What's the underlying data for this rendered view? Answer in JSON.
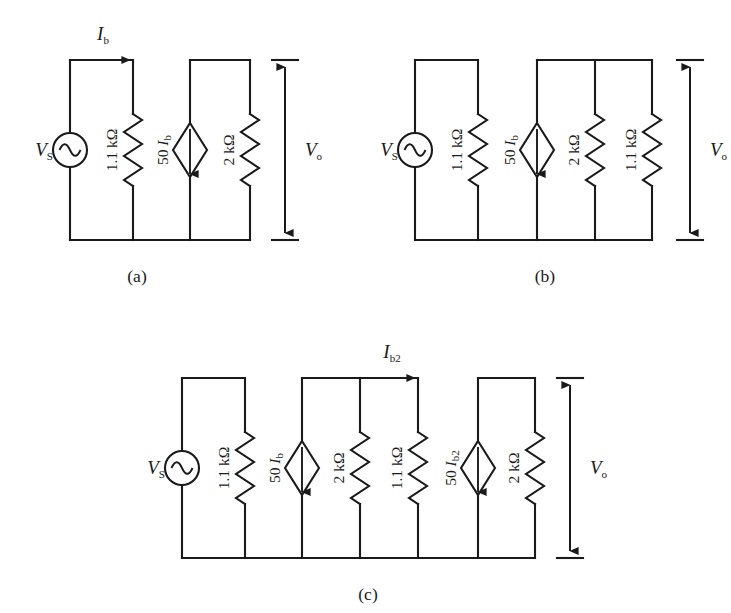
{
  "figure": {
    "line_color": "#1a1a1a",
    "background": "#ffffff",
    "captions": [
      {
        "id": "a",
        "text": "(a)"
      },
      {
        "id": "b",
        "text": "(b)"
      },
      {
        "id": "c",
        "text": "(c)"
      }
    ],
    "source_label": "V",
    "source_sub": "S",
    "output_label": "V",
    "output_sub": "o",
    "current_label": "I",
    "current_sub_a": "b",
    "current_sub_c": "b2"
  },
  "circuits": [
    {
      "id": "a",
      "caption": "(a)",
      "current_arrow": {
        "label_main": "I",
        "label_sub": "b",
        "visible": true
      },
      "output_arrow_label": {
        "main": "V",
        "sub": "o"
      },
      "branches": [
        {
          "type": "ac-source",
          "label_main": "V",
          "label_sub": "S",
          "label_side": "left"
        },
        {
          "type": "resistor",
          "label": "1.1 kΩ"
        },
        {
          "type": "dep-current-source",
          "label_prefix": "50 ",
          "label_main": "I",
          "label_sub": "b",
          "direction": "down"
        },
        {
          "type": "resistor",
          "label": "2 kΩ"
        }
      ]
    },
    {
      "id": "b",
      "caption": "(b)",
      "current_arrow": {
        "label_main": "I",
        "label_sub": "b",
        "visible": false
      },
      "output_arrow_label": {
        "main": "V",
        "sub": "o"
      },
      "branches": [
        {
          "type": "ac-source",
          "label_main": "V",
          "label_sub": "S",
          "label_side": "left"
        },
        {
          "type": "resistor",
          "label": "1.1 kΩ"
        },
        {
          "type": "dep-current-source",
          "label_prefix": "50 ",
          "label_main": "I",
          "label_sub": "b",
          "direction": "down"
        },
        {
          "type": "resistor",
          "label": "2 kΩ"
        },
        {
          "type": "resistor",
          "label": "1.1 kΩ"
        }
      ]
    },
    {
      "id": "c",
      "caption": "(c)",
      "current_arrow": {
        "label_main": "I",
        "label_sub": "b2",
        "visible": true
      },
      "output_arrow_label": {
        "main": "V",
        "sub": "o"
      },
      "branches": [
        {
          "type": "ac-source",
          "label_main": "V",
          "label_sub": "S",
          "label_side": "left"
        },
        {
          "type": "resistor",
          "label": "1.1 kΩ"
        },
        {
          "type": "dep-current-source",
          "label_prefix": "50 ",
          "label_main": "I",
          "label_sub": "b",
          "direction": "down"
        },
        {
          "type": "resistor",
          "label": "2 kΩ"
        },
        {
          "type": "resistor",
          "label": "1.1 kΩ"
        },
        {
          "type": "dep-current-source",
          "label_prefix": "50 ",
          "label_main": "I",
          "label_sub": "b2",
          "direction": "down"
        },
        {
          "type": "resistor",
          "label": "2 kΩ"
        }
      ]
    }
  ],
  "layout": {
    "a": {
      "x0": 70,
      "top": 60,
      "bottom": 240,
      "nodes": [
        70,
        133,
        190,
        250
      ],
      "vo_x": 285,
      "vo_top": 60,
      "vo_bottom": 240,
      "caption_x": 137,
      "caption_y": 282,
      "top_segments": [
        [
          70,
          133
        ],
        [
          190,
          250
        ]
      ],
      "iarrow": {
        "x1": 72,
        "x2": 133,
        "y": 60,
        "lx": 103,
        "ly": 40
      }
    },
    "b": {
      "x0": 415,
      "top": 60,
      "bottom": 240,
      "nodes": [
        415,
        478,
        537,
        595,
        652
      ],
      "vo_x": 690,
      "vo_top": 60,
      "vo_bottom": 240,
      "caption_x": 545,
      "caption_y": 282,
      "top_segments": [
        [
          415,
          478
        ],
        [
          537,
          652
        ]
      ],
      "iarrow": null
    },
    "c": {
      "x0": 182,
      "top": 378,
      "bottom": 558,
      "nodes": [
        182,
        245,
        302,
        360,
        418,
        478,
        535
      ],
      "vo_x": 570,
      "vo_top": 378,
      "vo_bottom": 558,
      "caption_x": 368,
      "caption_y": 600,
      "top_segments": [
        [
          182,
          245
        ],
        [
          302,
          418
        ],
        [
          478,
          535
        ]
      ],
      "iarrow": {
        "x1": 360,
        "x2": 418,
        "y": 378,
        "lx": 392,
        "ly": 358
      }
    }
  }
}
